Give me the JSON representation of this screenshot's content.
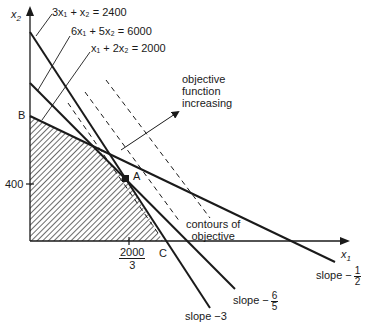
{
  "diagram": {
    "type": "linear-programming-feasible-region",
    "axes": {
      "x_label": "x",
      "x_label_sub": "1",
      "y_label": "x",
      "y_label_sub": "2"
    },
    "constraints": [
      {
        "label": "3x₁ + x₂ = 2400",
        "slope_label": "slope −3"
      },
      {
        "label": "6x₁ + 5x₂ = 6000",
        "slope_label_prefix": "slope −",
        "slope_num": "6",
        "slope_den": "5"
      },
      {
        "label": "x₁ + 2x₂ = 2000",
        "slope_label_prefix": "slope −",
        "slope_num": "1",
        "slope_den": "2"
      }
    ],
    "points": {
      "B": "B",
      "A": "A",
      "C": "C"
    },
    "ticks": {
      "y_tick": "400",
      "x_tick_num": "2000",
      "x_tick_den": "3"
    },
    "annotations": {
      "objective_line1": "objective",
      "objective_line2": "function",
      "objective_line3": "increasing",
      "contours_line1": "contours of",
      "contours_line2": "objective"
    },
    "colors": {
      "ink": "#1a1a1a",
      "background": "#ffffff"
    }
  }
}
